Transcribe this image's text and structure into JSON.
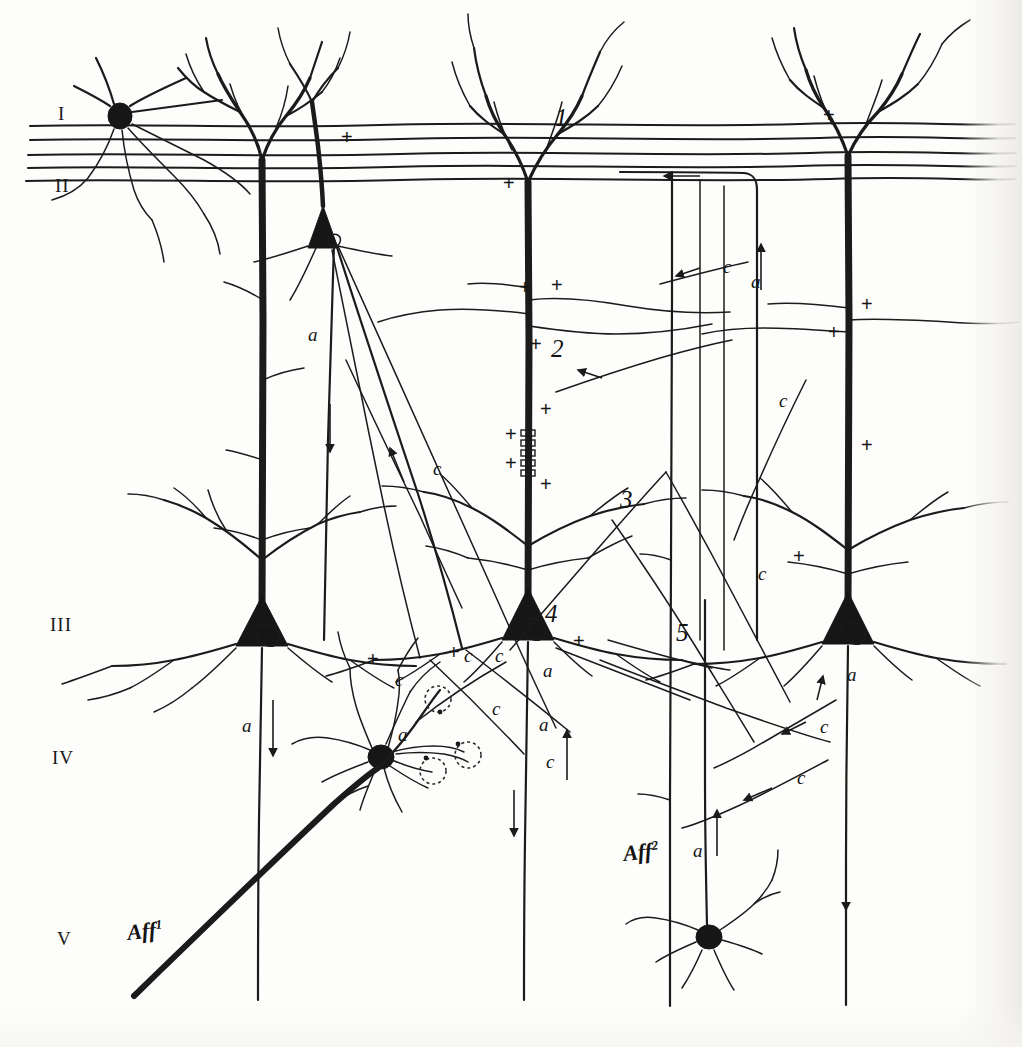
{
  "figure": {
    "kind": "neuroanatomical-schematic",
    "background_color": "#fdfdfc",
    "ink_color": "#1b1b1b"
  },
  "layer_labels": [
    {
      "id": "layer-1",
      "text": "I",
      "x": 58,
      "y": 120
    },
    {
      "id": "layer-2",
      "text": "II",
      "x": 55,
      "y": 192
    },
    {
      "id": "layer-3",
      "text": "III",
      "x": 50,
      "y": 631
    },
    {
      "id": "layer-4",
      "text": "IV",
      "x": 52,
      "y": 764
    },
    {
      "id": "layer-5",
      "text": "V",
      "x": 57,
      "y": 945
    }
  ],
  "numbered_markers": [
    {
      "id": "marker-1",
      "text": "1",
      "x": 555,
      "y": 126
    },
    {
      "id": "marker-2",
      "text": "2",
      "x": 551,
      "y": 357
    },
    {
      "id": "marker-3",
      "text": "3",
      "x": 620,
      "y": 508
    },
    {
      "id": "marker-4",
      "text": "4",
      "x": 545,
      "y": 622
    },
    {
      "id": "marker-5",
      "text": "5",
      "x": 676,
      "y": 641
    }
  ],
  "afferent_labels": [
    {
      "id": "aff-1",
      "base": "Aff",
      "sup": "1",
      "x": 128,
      "y": 940
    },
    {
      "id": "aff-2",
      "base": "Aff",
      "sup": "2",
      "x": 624,
      "y": 861
    }
  ],
  "axon_labels": [
    {
      "id": "a-1",
      "text": "a",
      "x": 308,
      "y": 341
    },
    {
      "id": "a-2",
      "text": "a",
      "x": 242,
      "y": 732
    },
    {
      "id": "a-3",
      "text": "a",
      "x": 398,
      "y": 741
    },
    {
      "id": "a-4",
      "text": "a",
      "x": 543,
      "y": 677
    },
    {
      "id": "a-5",
      "text": "a",
      "x": 539,
      "y": 731
    },
    {
      "id": "a-6",
      "text": "a",
      "x": 751,
      "y": 288
    },
    {
      "id": "a-7",
      "text": "a",
      "x": 847,
      "y": 681
    },
    {
      "id": "a-8",
      "text": "a",
      "x": 693,
      "y": 857
    }
  ],
  "collateral_labels": [
    {
      "id": "c-1",
      "text": "c",
      "x": 433,
      "y": 475
    },
    {
      "id": "c-2",
      "text": "c",
      "x": 395,
      "y": 686
    },
    {
      "id": "c-3",
      "text": "c",
      "x": 464,
      "y": 662
    },
    {
      "id": "c-4",
      "text": "c",
      "x": 495,
      "y": 662
    },
    {
      "id": "c-5",
      "text": "c",
      "x": 492,
      "y": 715
    },
    {
      "id": "c-6",
      "text": "c",
      "x": 546,
      "y": 768
    },
    {
      "id": "c-7",
      "text": "c",
      "x": 723,
      "y": 273
    },
    {
      "id": "c-8",
      "text": "c",
      "x": 779,
      "y": 407
    },
    {
      "id": "c-9",
      "text": "c",
      "x": 758,
      "y": 580
    },
    {
      "id": "c-10",
      "text": "c",
      "x": 820,
      "y": 733
    },
    {
      "id": "c-11",
      "text": "c",
      "x": 797,
      "y": 784
    }
  ],
  "plus_markers": [
    {
      "x": 341,
      "y": 144
    },
    {
      "x": 823,
      "y": 122
    },
    {
      "x": 503,
      "y": 190
    },
    {
      "x": 519,
      "y": 294
    },
    {
      "x": 551,
      "y": 292
    },
    {
      "x": 530,
      "y": 351
    },
    {
      "x": 540,
      "y": 416
    },
    {
      "x": 505,
      "y": 441
    },
    {
      "x": 505,
      "y": 470
    },
    {
      "x": 540,
      "y": 491
    },
    {
      "x": 861,
      "y": 311
    },
    {
      "x": 828,
      "y": 339
    },
    {
      "x": 861,
      "y": 452
    },
    {
      "x": 793,
      "y": 563
    },
    {
      "x": 367,
      "y": 666
    },
    {
      "x": 448,
      "y": 659
    },
    {
      "x": 573,
      "y": 648
    }
  ],
  "pyramidal_cells": [
    {
      "id": "pyramid-layer3-left",
      "soma_x": 262,
      "soma_y": 633
    },
    {
      "id": "pyramid-layer3-center",
      "soma_x": 528,
      "soma_y": 625
    },
    {
      "id": "pyramid-layer3-right",
      "soma_x": 848,
      "soma_y": 628
    },
    {
      "id": "pyramid-layer2-small",
      "soma_x": 323,
      "soma_y": 228
    },
    {
      "id": "pyramid-layer1-horizontal",
      "soma_x": 120,
      "soma_y": 116
    }
  ],
  "stellate_cells": [
    {
      "id": "stellate-layer4",
      "soma_x": 381,
      "soma_y": 757
    },
    {
      "id": "stellate-layer5",
      "soma_x": 709,
      "soma_y": 937
    }
  ],
  "terminal_boutons": [
    {
      "id": "bouton-1",
      "cx": 438,
      "cy": 699,
      "r": 13
    },
    {
      "id": "bouton-2",
      "cx": 433,
      "cy": 771,
      "r": 13
    },
    {
      "id": "bouton-3",
      "cx": 468,
      "cy": 755,
      "r": 13
    }
  ]
}
